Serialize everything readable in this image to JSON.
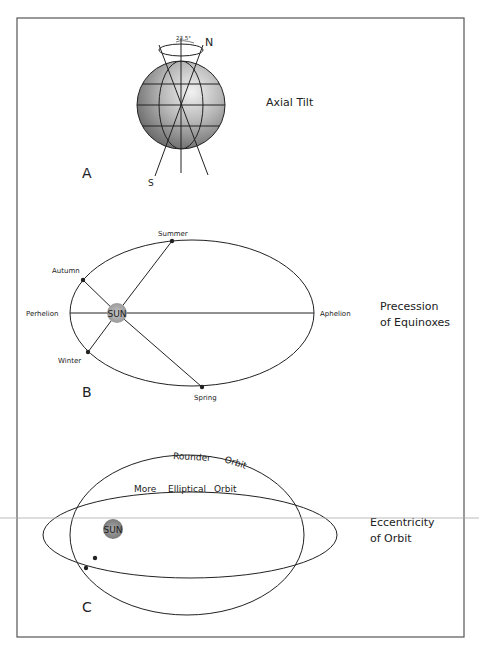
{
  "panels": {
    "A": {
      "letter": "A",
      "title": "Axial Tilt",
      "north_label": "N",
      "south_label": "S",
      "angle_label": "23.5°"
    },
    "B": {
      "letter": "B",
      "title_line1": "Precession",
      "title_line2": "of Equinoxes",
      "sun_label": "SUN",
      "perihelion_label": "Perhelion",
      "aphelion_label": "Aphelion",
      "summer_label": "Summer",
      "autumn_label": "Autumn",
      "winter_label": "Winter",
      "spring_label": "Spring"
    },
    "C": {
      "letter": "C",
      "title_line1": "Eccentricity",
      "title_line2": "of Orbit",
      "sun_label": "SUN",
      "rounder_label_1": "Rounder",
      "rounder_label_2": "Orbit",
      "elliptical_label_1": "More",
      "elliptical_label_2": "Elliptical",
      "elliptical_label_3": "Orbit"
    }
  },
  "colors": {
    "frame": "#555555",
    "line": "#222222",
    "sun_fill": "#aaaaaa",
    "sphere_light": "#e8e8e8",
    "sphere_dark": "#6a6a6a",
    "scan_line": "#aaaaaa"
  }
}
